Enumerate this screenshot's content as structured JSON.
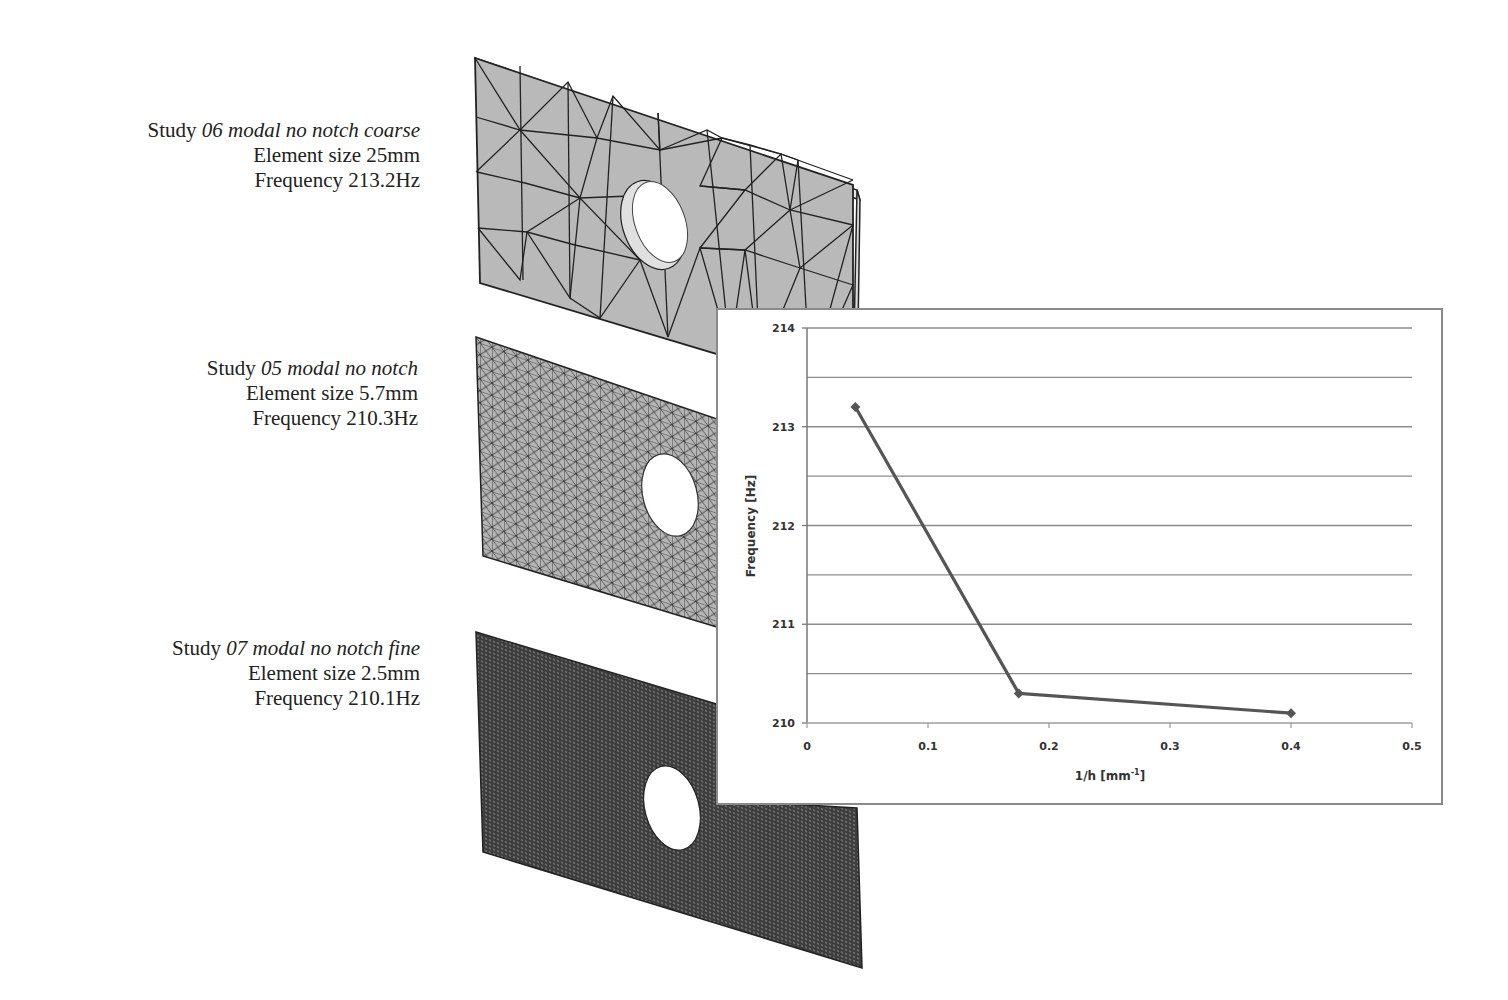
{
  "studies": [
    {
      "prefix": "Study ",
      "name": "06 modal no notch coarse",
      "element_size": "Element size 25mm",
      "frequency": "Frequency 213.2Hz",
      "mesh": "coarse"
    },
    {
      "prefix": "Study ",
      "name": "05 modal no notch",
      "element_size": "Element size 5.7mm",
      "frequency": "Frequency 210.3Hz",
      "mesh": "medium"
    },
    {
      "prefix": "Study ",
      "name": "07 modal no notch fine",
      "element_size": "Element size 2.5mm",
      "frequency": "Frequency 210.1Hz",
      "mesh": "fine"
    }
  ],
  "colors": {
    "plate_fill": "#b8b8b8",
    "mesh_line": "#2a2a2a",
    "fine_plate": "#4a4a4a",
    "series_line": "#555555",
    "gridline": "#8c8c8c"
  },
  "chart_data": {
    "type": "line",
    "title": "",
    "xlabel": "1/h [mm",
    "xlabel_sup": "-1",
    "xlabel_close": "]",
    "ylabel": "Frequency [Hz]",
    "xlim": [
      0,
      0.5
    ],
    "ylim": [
      210,
      214
    ],
    "x_ticks": [
      "0",
      "0.1",
      "0.2",
      "0.3",
      "0.4",
      "0.5"
    ],
    "y_ticks": [
      "210",
      "211",
      "212",
      "213",
      "214"
    ],
    "grid": "horizontal, every 0.5 Hz",
    "legend": "none",
    "series": [
      {
        "name": "Frequency",
        "marker": "diamond",
        "x": [
          0.04,
          0.175,
          0.4
        ],
        "y": [
          213.2,
          210.3,
          210.1
        ]
      }
    ]
  }
}
